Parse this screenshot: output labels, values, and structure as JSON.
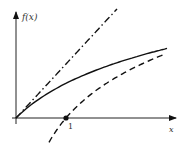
{
  "chart_data": {
    "type": "line",
    "title": "",
    "xlabel": "x",
    "ylabel": "f(x)",
    "x_ticks": [
      {
        "value": 1,
        "label": "1"
      }
    ],
    "xlim": [
      0,
      3.2
    ],
    "ylim": [
      -0.5,
      2.1
    ],
    "grid": false,
    "legend": null,
    "series": [
      {
        "name": "f(x) = x",
        "style": "dash-dot",
        "x": [
          0,
          0.5,
          1,
          1.5,
          2.0
        ],
        "y": [
          0,
          0.5,
          1,
          1.5,
          2.0
        ]
      },
      {
        "name": "f(x) = ln(1+x)",
        "style": "solid",
        "x": [
          0,
          0.5,
          1,
          1.5,
          2,
          2.5,
          3
        ],
        "y": [
          0,
          0.41,
          0.69,
          0.92,
          1.1,
          1.25,
          1.39
        ]
      },
      {
        "name": "f(x) = ln(x)",
        "style": "dashed",
        "x": [
          0.68,
          1,
          1.5,
          2,
          2.5,
          3
        ],
        "y": [
          -0.5,
          0,
          0.41,
          0.69,
          0.92,
          1.1
        ]
      }
    ],
    "annotations": [
      {
        "type": "point",
        "x": 1,
        "y": 0,
        "label": "1"
      }
    ]
  },
  "labels": {
    "y_axis": "f(x)",
    "x_axis": "x",
    "tick_one": "1"
  }
}
